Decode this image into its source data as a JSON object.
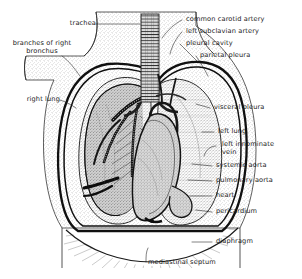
{
  "figure": {
    "style": "pen-and-ink stipple line engraving",
    "background_color": "#ffffff",
    "ink_color": "#1a1a1a",
    "width": 302,
    "height": 279
  },
  "labels": {
    "trachea": "trachea",
    "branches_of_right_bronchus": "branches of right\nbronchus",
    "right_lung": "right lung",
    "common_carotid_artery": "common carotid artery",
    "left_subclavian_artery": "left subclavian artery",
    "pleural_cavity": "pleural cavity",
    "parietal_pleura": "parietal pleura",
    "visceral_pleura": "visceral pleura",
    "left_lung": "left lung",
    "left_innominate_vein": "left innominate\nvein",
    "systemic_aorta": "systemic aorta",
    "pulmonary_aorta": "pulmonary aorta",
    "heart": "heart",
    "pericardium": "pericardium",
    "diaphragm": "diaphragm",
    "mediastinal_septum": "mediastinal septum"
  },
  "structures": [
    "body wall",
    "trachea with cartilage rings",
    "right lung (cut away, bronchial tree exposed)",
    "left lung (stippled, intact)",
    "heart and pericardium",
    "aortic arch",
    "diaphragm with radiating muscle fibres",
    "mediastinal septum"
  ]
}
